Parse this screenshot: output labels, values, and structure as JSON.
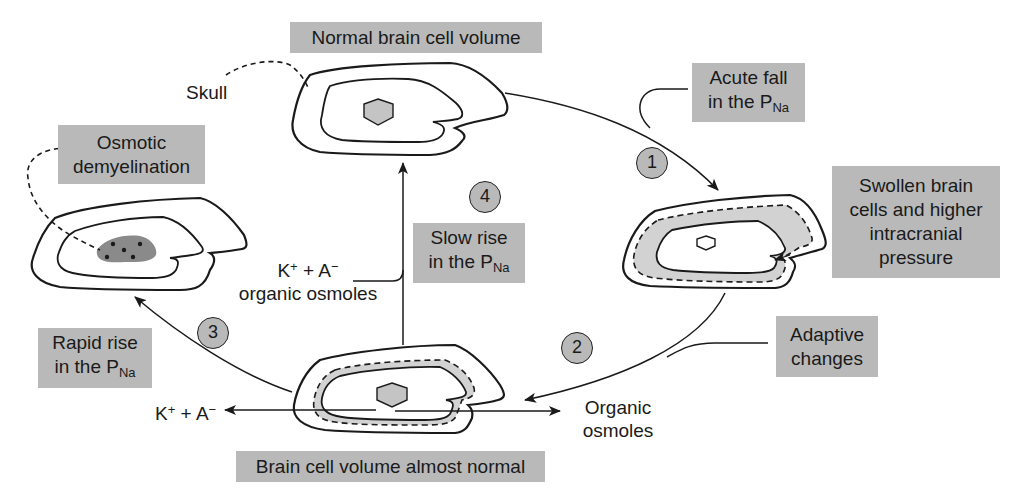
{
  "diagram": {
    "type": "cycle",
    "colors": {
      "label_box": "#b9b9b9",
      "nucleus": "#c4c4c4",
      "demyelination_patch": "#8a8a8a",
      "swelling_zone": "#d2d2d2",
      "line": "#1a1a1a",
      "background": "#ffffff"
    },
    "states": {
      "normal": {
        "label": "Normal brain cell volume"
      },
      "swollen": {
        "label_lines": [
          "Swollen brain",
          "cells and higher",
          "intracranial",
          "pressure"
        ]
      },
      "almost_normal": {
        "label": "Brain cell volume almost normal"
      },
      "demyelination": {
        "label_lines": [
          "Osmotic",
          "demyelination"
        ]
      }
    },
    "annotations": {
      "skull": "Skull",
      "acute_fall": {
        "line1": "Acute fall",
        "line2_prefix": "in the P",
        "line2_sub": "Na"
      },
      "adaptive_changes": {
        "line1": "Adaptive",
        "line2": "changes"
      },
      "slow_rise": {
        "line1": "Slow rise",
        "line2_prefix": "in the P",
        "line2_sub": "Na"
      },
      "rapid_rise": {
        "line1": "Rapid rise",
        "line2_prefix": "in the P",
        "line2_sub": "Na"
      },
      "influx_center": {
        "k": "K",
        "k_sup": "+",
        "plus": " + ",
        "a": "A",
        "a_sup": "−",
        "line2": "organic osmoles"
      },
      "efflux_left": {
        "k": "K",
        "k_sup": "+",
        "plus": " + ",
        "a": "A",
        "a_sup": "−"
      },
      "efflux_right": {
        "line1": "Organic",
        "line2": "osmoles"
      }
    },
    "steps": [
      {
        "number": "1",
        "from": "normal",
        "to": "swollen",
        "trigger": "Acute fall in the PNa"
      },
      {
        "number": "2",
        "from": "swollen",
        "to": "almost_normal",
        "trigger": "Adaptive changes"
      },
      {
        "number": "3",
        "from": "almost_normal",
        "to": "demyelination",
        "trigger": "Rapid rise in the PNa"
      },
      {
        "number": "4",
        "from": "almost_normal",
        "to": "normal",
        "trigger": "Slow rise in the PNa"
      }
    ]
  }
}
